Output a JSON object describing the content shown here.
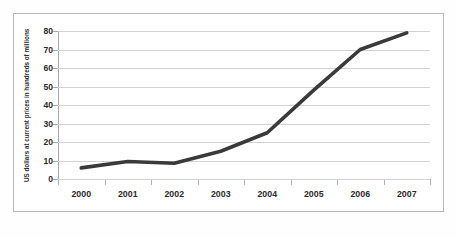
{
  "chart_data": {
    "type": "line",
    "title": "",
    "subtitle": "",
    "xlabel": "",
    "ylabel": "US dollars at current prices in hundreds of millions",
    "categories": [
      "2000",
      "2001",
      "2002",
      "2003",
      "2004",
      "2005",
      "2006",
      "2007"
    ],
    "series": [
      {
        "name": "US dollars at current prices",
        "values": [
          6,
          9.5,
          8.5,
          15,
          25,
          48,
          70,
          79
        ]
      }
    ],
    "x": [
      "2000",
      "2001",
      "2002",
      "2003",
      "2004",
      "2005",
      "2006",
      "2007"
    ],
    "values": [
      6,
      9.5,
      8.5,
      15,
      25,
      48,
      70,
      79
    ],
    "ylim": [
      0,
      80
    ],
    "y_ticks": [
      0,
      10,
      20,
      30,
      40,
      50,
      60,
      70,
      80
    ],
    "y_tick_labels": [
      "0",
      "10",
      "20",
      "30",
      "40",
      "50",
      "60",
      "70",
      "80"
    ],
    "xlim": [
      "2000",
      "2007"
    ],
    "grid": "horizontal",
    "legend": "none",
    "annotations": [],
    "colors": {
      "line": "#3a3a3a",
      "gridline": "#d2d2d2",
      "axis": "#a8a8a8",
      "text": "#2b2b2b",
      "plot_background": "#ffffff",
      "figure_border": "#b9b9b9"
    },
    "line_width_px": 3.6
  }
}
